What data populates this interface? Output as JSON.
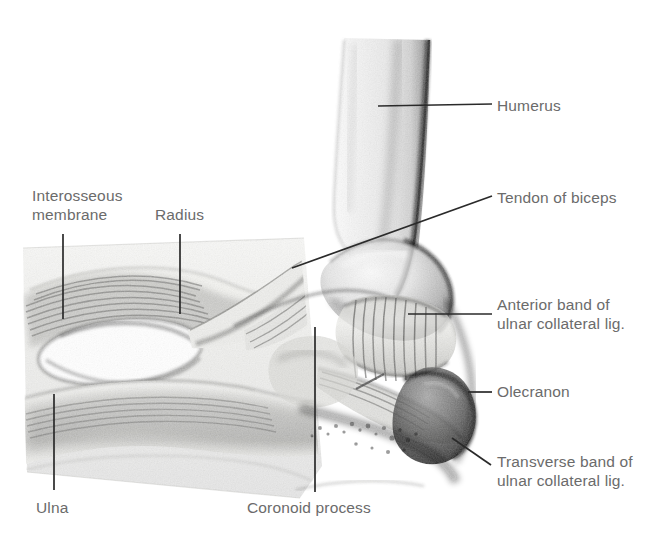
{
  "figure": {
    "style": "pencil / graphite anatomical illustration",
    "background_color": "#ffffff",
    "label_color": "#6b6b6b",
    "leader_line_color": "#2a2a2a"
  },
  "annotations": [
    {
      "id": "humerus",
      "label": "Humerus",
      "side": "right",
      "text_x": 497,
      "text_y": 96,
      "leader": {
        "type": "line",
        "x1": 378,
        "y1": 106,
        "x2": 492,
        "y2": 104
      }
    },
    {
      "id": "tendon-of-biceps",
      "label": "Tendon of biceps",
      "side": "right",
      "text_x": 497,
      "text_y": 188,
      "leader": {
        "type": "line",
        "x1": 292,
        "y1": 268,
        "x2": 492,
        "y2": 196
      }
    },
    {
      "id": "anterior-band-of-ulnar-collateral-lig",
      "label": "Anterior band of\nulnar collateral lig.",
      "side": "right",
      "text_x": 497,
      "text_y": 295,
      "leader": {
        "type": "line",
        "x1": 408,
        "y1": 314,
        "x2": 492,
        "y2": 314
      }
    },
    {
      "id": "olecranon",
      "label": "Olecranon",
      "side": "right",
      "text_x": 497,
      "text_y": 382,
      "leader": {
        "type": "line",
        "x1": 468,
        "y1": 392,
        "x2": 492,
        "y2": 392
      }
    },
    {
      "id": "transverse-band-of-ulnar-collateral-lig",
      "label": "Transverse band of\nulnar collateral lig.",
      "side": "right",
      "text_x": 497,
      "text_y": 452,
      "leader": {
        "type": "line",
        "x1": 452,
        "y1": 438,
        "x2": 491,
        "y2": 465
      }
    },
    {
      "id": "interosseous-membrane",
      "label": "Interosseous\nmembrane",
      "side": "left",
      "text_x": 32,
      "text_y": 186,
      "leader": {
        "type": "line",
        "x1": 63,
        "y1": 234,
        "x2": 63,
        "y2": 319
      }
    },
    {
      "id": "radius",
      "label": "Radius",
      "side": "left",
      "text_x": 155,
      "text_y": 205,
      "leader": {
        "type": "line",
        "x1": 180,
        "y1": 234,
        "x2": 180,
        "y2": 314
      }
    },
    {
      "id": "ulna",
      "label": "Ulna",
      "side": "left",
      "text_x": 36,
      "text_y": 498,
      "leader": {
        "type": "line",
        "x1": 54,
        "y1": 394,
        "x2": 54,
        "y2": 490
      }
    },
    {
      "id": "coronoid-process",
      "label": "Coronoid process",
      "side": "center",
      "text_x": 247,
      "text_y": 498,
      "leader": {
        "type": "line",
        "x1": 315,
        "y1": 327,
        "x2": 315,
        "y2": 492
      }
    }
  ]
}
